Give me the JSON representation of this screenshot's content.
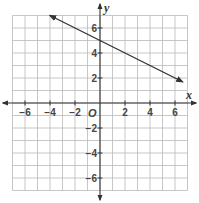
{
  "chart_data": {
    "type": "line",
    "title": "",
    "xlabel": "x",
    "ylabel": "y",
    "origin_label": "O",
    "xlim": [
      -7,
      7
    ],
    "ylim": [
      -7,
      7
    ],
    "grid": true,
    "grid_step": 1,
    "x_tick_labels": [
      "−6",
      "−4",
      "−2",
      "2",
      "4",
      "6"
    ],
    "x_ticks": [
      -6,
      -4,
      -2,
      2,
      4,
      6
    ],
    "y_tick_labels": [
      "6",
      "4",
      "2",
      "−2",
      "−4",
      "−6"
    ],
    "y_ticks": [
      6,
      4,
      2,
      -2,
      -4,
      -6
    ],
    "series": [
      {
        "name": "line",
        "equation": "y = -0.5x + 5",
        "slope": -0.5,
        "y_intercept": 5,
        "x": [
          -4,
          6.6
        ],
        "y": [
          7,
          1.7
        ],
        "arrows_both_ends": true,
        "color": "#333333"
      }
    ],
    "legend": null
  }
}
